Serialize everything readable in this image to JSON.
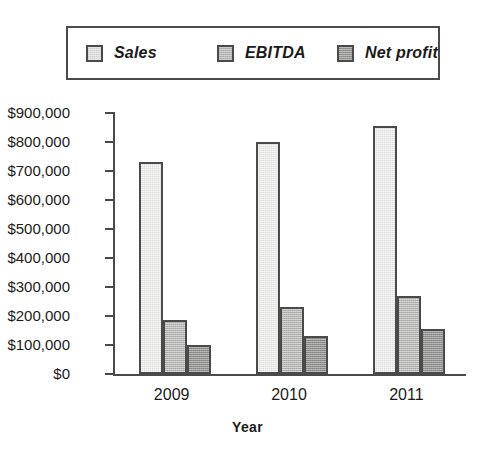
{
  "chart_data": {
    "type": "bar",
    "title": "",
    "subtitle": "",
    "xlabel": "Year",
    "ylabel": "",
    "categories": [
      "2009",
      "2010",
      "2011"
    ],
    "series": [
      {
        "name": "Sales",
        "values": [
          730000,
          800000,
          855000
        ],
        "color": "#dededc"
      },
      {
        "name": "EBITDA",
        "values": [
          185000,
          230000,
          270000
        ],
        "color": "#b5b5b3"
      },
      {
        "name": "Net profit",
        "values": [
          100000,
          130000,
          155000
        ],
        "color": "#929290"
      }
    ],
    "ylim": [
      0,
      900000
    ],
    "ytick_values": [
      0,
      100000,
      200000,
      300000,
      400000,
      500000,
      600000,
      700000,
      800000,
      900000
    ],
    "ytick_labels": [
      "$0",
      "$100,000",
      "$200,000",
      "$300,000",
      "$400,000",
      "$500,000",
      "$600,000",
      "$700,000",
      "$800,000",
      "$900,000"
    ],
    "grid": false,
    "legend_position": "top",
    "legend_entries": [
      "Sales",
      "EBITDA",
      "Net profit"
    ],
    "border_color": "#4a4a4a",
    "text_color": "#1b1b1b",
    "background": "#ffffff"
  }
}
